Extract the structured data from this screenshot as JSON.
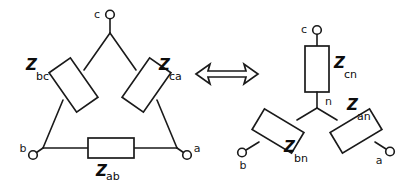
{
  "figure": {
    "background_color": "#ffffff",
    "line_color": "#1a1a1a",
    "text_color": "#0d0d0d"
  },
  "equivalence_symbol": {
    "name": "double-headed-arrow",
    "glyph": "⟺"
  },
  "delta_network": {
    "label": "delta-configuration",
    "terminals": [
      {
        "id": "c",
        "label": "c",
        "position": "top"
      },
      {
        "id": "b",
        "label": "b",
        "position": "bottom-left"
      },
      {
        "id": "a",
        "label": "a",
        "position": "bottom-right"
      }
    ],
    "impedances": [
      {
        "id": "zbc",
        "symbol": "Z",
        "subscript": "bc",
        "orientation": "left-leg"
      },
      {
        "id": "zca",
        "symbol": "Z",
        "subscript": "ca",
        "orientation": "right-leg"
      },
      {
        "id": "zab",
        "symbol": "Z",
        "subscript": "ab",
        "orientation": "bottom-horizontal"
      }
    ]
  },
  "wye_network": {
    "label": "wye-configuration",
    "terminals": [
      {
        "id": "c",
        "label": "c",
        "position": "top"
      },
      {
        "id": "b",
        "label": "b",
        "position": "bottom-left"
      },
      {
        "id": "a",
        "label": "a",
        "position": "bottom-right"
      },
      {
        "id": "n",
        "label": "n",
        "position": "center-neutral"
      }
    ],
    "impedances": [
      {
        "id": "zcn",
        "symbol": "Z",
        "subscript": "cn",
        "orientation": "vertical-top"
      },
      {
        "id": "zbn",
        "symbol": "Z",
        "subscript": "bn",
        "orientation": "lower-left"
      },
      {
        "id": "zan",
        "symbol": "Z",
        "subscript": "an",
        "orientation": "lower-right"
      }
    ]
  }
}
